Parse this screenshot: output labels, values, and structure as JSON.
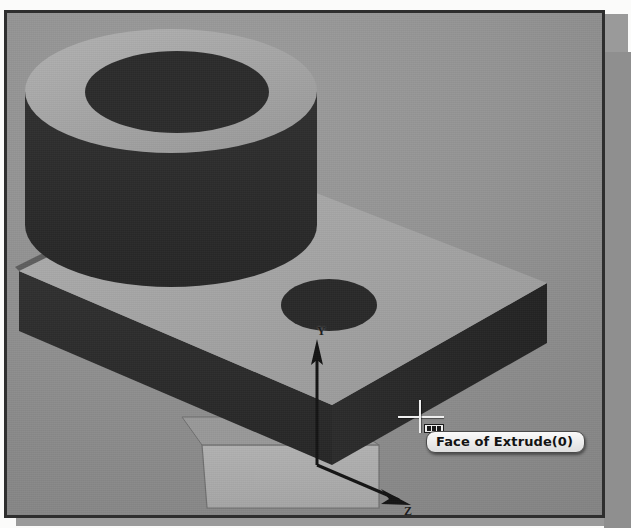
{
  "app": {
    "view_type": "3d-graphics-viewport",
    "background_color": "#8f8f8f",
    "border_color": "#2e2e2e"
  },
  "viewport": {
    "name": "graphics-area",
    "model_name": "Extrude(0)",
    "shading_mode": "shaded",
    "face_colors": {
      "lit_top": "#a8a8a8",
      "shadow_side": "#2c2c2c",
      "hole_bore": "#2a2a2a",
      "reference_plane": "#b0b0b0"
    }
  },
  "triad": {
    "name": "coordinate-triad",
    "axes": [
      {
        "id": "y",
        "label": "Y",
        "direction": "up"
      },
      {
        "id": "z",
        "label": "Z",
        "direction": "down-right"
      }
    ]
  },
  "cursor": {
    "name": "select-face-cursor",
    "type": "crosshair",
    "glyph": "face-select-icon",
    "x": 414,
    "y": 403
  },
  "tooltip": {
    "name": "entity-tooltip",
    "text": "Face of Extrude(0)",
    "background_color": "#ededed",
    "text_color": "#131313"
  },
  "geometry": {
    "features": [
      {
        "name": "base-plate",
        "type": "extrude",
        "label": "Extrude(0)"
      },
      {
        "name": "cylindrical-boss",
        "type": "extrude",
        "label": "Boss"
      },
      {
        "name": "boss-through-bore",
        "type": "cut",
        "label": "Bore"
      },
      {
        "name": "plate-hole",
        "type": "cut",
        "label": "Hole"
      }
    ]
  }
}
